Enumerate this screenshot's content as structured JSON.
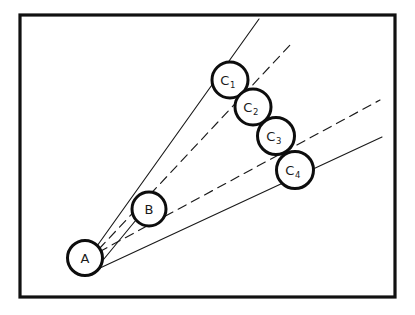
{
  "figure": {
    "background_color": "#ffffff",
    "ink_color": "#111111",
    "frame": {
      "name": "outer-frame",
      "x": 20,
      "y": 15,
      "width": 375,
      "height": 282,
      "stroke_width": 3.2
    },
    "nodes": [
      {
        "id": "A",
        "label": "A",
        "subscript": "",
        "cx": 85,
        "cy": 258,
        "r": 17.5
      },
      {
        "id": "B",
        "label": "B",
        "subscript": "",
        "cx": 149,
        "cy": 209,
        "r": 17.0
      },
      {
        "id": "C1",
        "label": "C",
        "subscript": "1",
        "cx": 230,
        "cy": 80,
        "r": 18.0
      },
      {
        "id": "C2",
        "label": "C",
        "subscript": "2",
        "cx": 253,
        "cy": 107,
        "r": 18.0
      },
      {
        "id": "C3",
        "label": "C",
        "subscript": "3",
        "cx": 276,
        "cy": 136,
        "r": 18.5
      },
      {
        "id": "C4",
        "label": "C",
        "subscript": "4",
        "cx": 295,
        "cy": 170,
        "r": 18.5
      }
    ],
    "rays": [
      {
        "id": "ray-1",
        "style": "solid",
        "x1": 97,
        "y1": 246,
        "x2": 259,
        "y2": 19
      },
      {
        "id": "ray-2",
        "style": "dashed",
        "x1": 99,
        "y1": 249,
        "x2": 291,
        "y2": 44
      },
      {
        "id": "ray-3",
        "style": "dashed",
        "x1": 99,
        "y1": 252,
        "x2": 380,
        "y2": 100
      },
      {
        "id": "ray-4",
        "style": "solid",
        "x1": 100,
        "y1": 268,
        "x2": 382,
        "y2": 137
      },
      {
        "id": "ray-5",
        "style": "solid",
        "x1": 99,
        "y1": 265,
        "x2": 136,
        "y2": 220
      }
    ]
  }
}
